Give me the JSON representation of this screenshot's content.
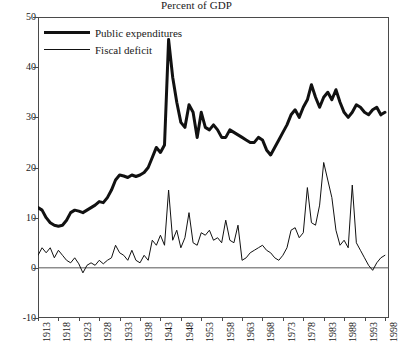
{
  "chart_data": {
    "type": "line",
    "title": "Percent of GDP",
    "xlabel": "",
    "ylabel": "",
    "ylim": [
      -10,
      50
    ],
    "xlim": [
      1913,
      1999
    ],
    "grid": false,
    "legend_position": "top-left",
    "ytick_labels": [
      "50",
      "40",
      "30",
      "20",
      "10",
      "0",
      "-10"
    ],
    "ytick_values": [
      50,
      40,
      30,
      20,
      10,
      0,
      -10
    ],
    "xtick_labels": [
      "1913",
      "1918",
      "1923",
      "1928",
      "1933",
      "1938",
      "1943",
      "1948",
      "1953",
      "1958",
      "1963",
      "1968",
      "1973",
      "1978",
      "1983",
      "1988",
      "1993",
      "1998"
    ],
    "xtick_values": [
      1913,
      1918,
      1923,
      1928,
      1933,
      1938,
      1943,
      1948,
      1953,
      1958,
      1963,
      1968,
      1973,
      1978,
      1983,
      1988,
      1993,
      1998
    ],
    "zero_line": 0,
    "series": [
      {
        "name": "Public expenditures",
        "color": "#111111",
        "line_width": 3,
        "x": [
          1913,
          1914,
          1915,
          1916,
          1917,
          1918,
          1919,
          1920,
          1921,
          1922,
          1923,
          1924,
          1925,
          1926,
          1927,
          1928,
          1929,
          1930,
          1931,
          1932,
          1933,
          1934,
          1935,
          1936,
          1937,
          1938,
          1939,
          1940,
          1941,
          1942,
          1943,
          1944,
          1945,
          1946,
          1947,
          1948,
          1949,
          1950,
          1951,
          1952,
          1953,
          1954,
          1955,
          1956,
          1957,
          1958,
          1959,
          1960,
          1961,
          1962,
          1963,
          1964,
          1965,
          1966,
          1967,
          1968,
          1969,
          1970,
          1971,
          1972,
          1973,
          1974,
          1975,
          1976,
          1977,
          1978,
          1979,
          1980,
          1981,
          1982,
          1983,
          1984,
          1985,
          1986,
          1987,
          1988,
          1989,
          1990,
          1991,
          1992,
          1993,
          1994,
          1995,
          1996,
          1997,
          1998
        ],
        "values": [
          12.0,
          11.5,
          10.0,
          9.0,
          8.5,
          8.3,
          8.5,
          9.5,
          11.0,
          11.5,
          11.3,
          11.0,
          11.5,
          12.0,
          12.5,
          13.2,
          13.0,
          14.0,
          15.5,
          17.5,
          18.5,
          18.3,
          18.0,
          18.5,
          18.2,
          18.5,
          19.0,
          20.0,
          22.0,
          24.0,
          23.0,
          24.5,
          45.5,
          38.0,
          33.0,
          29.0,
          28.0,
          32.5,
          31.0,
          26.0,
          31.0,
          28.0,
          27.5,
          28.5,
          27.5,
          26.0,
          26.0,
          27.5,
          27.0,
          26.5,
          26.0,
          25.5,
          25.0,
          25.0,
          26.0,
          25.5,
          23.5,
          22.5,
          24.0,
          25.5,
          27.0,
          28.5,
          30.5,
          31.5,
          30.0,
          32.0,
          33.5,
          36.5,
          34.0,
          32.0,
          34.0,
          35.0,
          33.5,
          35.5,
          33.0,
          31.0,
          30.0,
          31.0,
          32.5,
          32.0,
          31.0,
          30.5,
          31.5,
          32.0,
          30.5,
          31.0
        ]
      },
      {
        "name": "Fiscal deficit",
        "color": "#111111",
        "line_width": 1,
        "x": [
          1913,
          1914,
          1915,
          1916,
          1917,
          1918,
          1919,
          1920,
          1921,
          1922,
          1923,
          1924,
          1925,
          1926,
          1927,
          1928,
          1929,
          1930,
          1931,
          1932,
          1933,
          1934,
          1935,
          1936,
          1937,
          1938,
          1939,
          1940,
          1941,
          1942,
          1943,
          1944,
          1945,
          1946,
          1947,
          1948,
          1949,
          1950,
          1951,
          1952,
          1953,
          1954,
          1955,
          1956,
          1957,
          1958,
          1959,
          1960,
          1961,
          1962,
          1963,
          1964,
          1965,
          1966,
          1967,
          1968,
          1969,
          1970,
          1971,
          1972,
          1973,
          1974,
          1975,
          1976,
          1977,
          1978,
          1979,
          1980,
          1981,
          1982,
          1983,
          1984,
          1985,
          1986,
          1987,
          1988,
          1989,
          1990,
          1991,
          1992,
          1993,
          1994,
          1995,
          1996,
          1997,
          1998
        ],
        "values": [
          2.5,
          4.0,
          3.0,
          4.0,
          2.0,
          3.5,
          2.5,
          1.5,
          1.0,
          2.0,
          0.8,
          -1.0,
          0.5,
          1.0,
          0.5,
          1.5,
          0.8,
          1.5,
          2.0,
          4.5,
          3.0,
          2.5,
          1.5,
          3.5,
          1.5,
          1.0,
          2.5,
          1.5,
          5.5,
          4.5,
          6.5,
          4.5,
          15.5,
          5.5,
          7.5,
          4.0,
          6.0,
          11.0,
          5.0,
          4.5,
          7.0,
          6.5,
          7.5,
          5.5,
          6.0,
          5.0,
          9.5,
          5.5,
          5.0,
          8.5,
          1.5,
          2.0,
          3.0,
          3.5,
          4.0,
          4.5,
          3.5,
          3.0,
          2.0,
          1.5,
          2.5,
          4.0,
          7.5,
          8.0,
          6.0,
          7.0,
          16.0,
          9.0,
          8.5,
          12.5,
          21.0,
          17.5,
          14.0,
          7.5,
          4.5,
          5.5,
          4.0,
          16.5,
          5.0,
          3.5,
          2.0,
          0.5,
          -0.5,
          1.0,
          2.0,
          2.5
        ]
      }
    ]
  }
}
